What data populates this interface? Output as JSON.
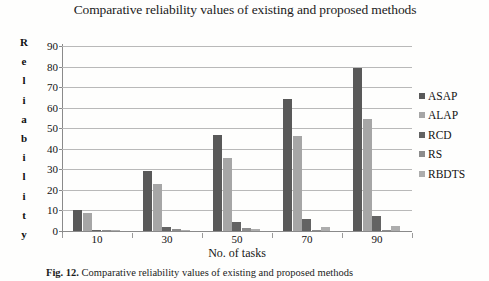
{
  "chart_data": {
    "type": "bar",
    "title": "Comparative reliability values of existing and proposed methods",
    "xlabel": "No. of tasks",
    "ylabel": "Reliability",
    "ylabel_letters": [
      "R",
      "e",
      "l",
      "i",
      "a",
      "b",
      "i",
      "l",
      "i",
      "t",
      "y"
    ],
    "categories": [
      "10",
      "30",
      "50",
      "70",
      "90"
    ],
    "yticks": [
      "90",
      "80",
      "70",
      "60",
      "50",
      "40",
      "30",
      "20",
      "10",
      "0"
    ],
    "ylim": [
      0,
      90
    ],
    "grid": true,
    "legend_position": "right",
    "series": [
      {
        "name": "ASAP",
        "color": "#595959",
        "values": [
          10.2,
          29.0,
          46.5,
          64.0,
          79.5
        ]
      },
      {
        "name": "ALAP",
        "color": "#a6a6a6",
        "values": [
          8.7,
          23.0,
          35.5,
          46.0,
          54.5
        ]
      },
      {
        "name": "RCD",
        "color": "#636363",
        "values": [
          0.6,
          2.1,
          4.2,
          5.7,
          7.3
        ]
      },
      {
        "name": "RS",
        "color": "#8c8c8c",
        "values": [
          0.2,
          0.8,
          1.7,
          0.4,
          0.3
        ]
      },
      {
        "name": "RBDTS",
        "color": "#adadad",
        "values": [
          0.15,
          0.6,
          1.2,
          1.8,
          2.3
        ]
      }
    ]
  },
  "caption": {
    "figure_label": "Fig. 12.",
    "text": "Comparative reliability values of existing and proposed methods"
  }
}
